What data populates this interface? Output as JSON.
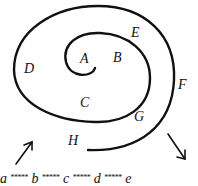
{
  "diagram": {
    "type": "spiral",
    "stroke_color": "#111111",
    "regions": {
      "A": "A",
      "B": "B",
      "C": "C",
      "D": "D",
      "E": "E",
      "F": "F",
      "G": "G",
      "H": "H"
    },
    "arrows": [
      {
        "name": "arrow-up-right",
        "direction": "up-right"
      },
      {
        "name": "arrow-down-right",
        "direction": "down-right"
      }
    ],
    "sequence": {
      "items": [
        "a",
        "b",
        "c",
        "d",
        "e"
      ],
      "separator": "*****"
    }
  }
}
